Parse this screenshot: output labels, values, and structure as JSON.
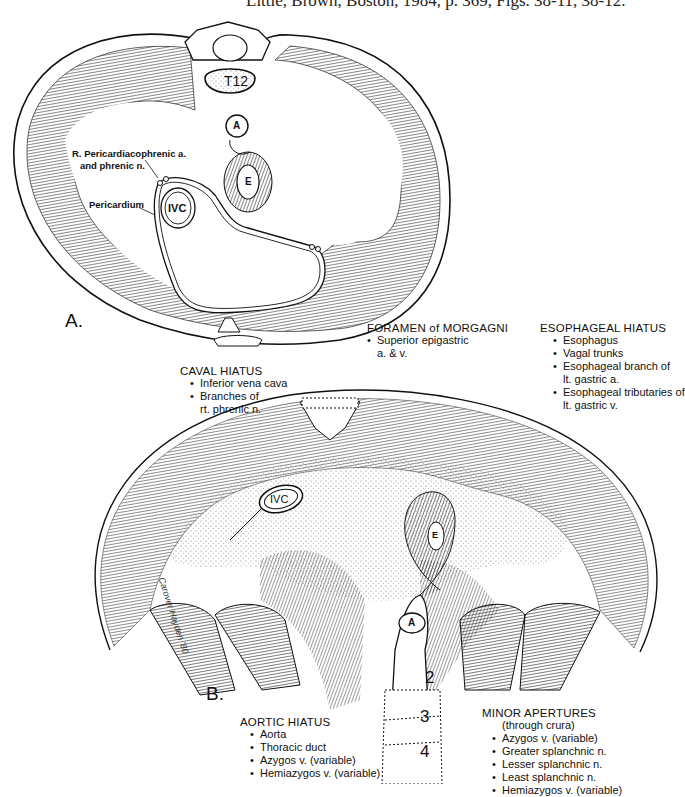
{
  "citation": "Little, Brown, Boston, 1984, p. 369, Figs. 38-11, 38-12.",
  "figure_a": {
    "label": "A.",
    "labels": {
      "vertebra": "T12",
      "aorta": "A",
      "esophagus": "E",
      "ivc": "IVC",
      "pericardiacophrenic_line1": "R. Pericardiacophrenic a.",
      "pericardiacophrenic_line2": "and phrenic n.",
      "pericardium": "Pericardium"
    }
  },
  "figure_b": {
    "label": "B.",
    "labels": {
      "ivc": "IVC",
      "esophagus": "E",
      "aorta": "A",
      "vertebrae": [
        "2",
        "3",
        "4"
      ],
      "signature": "Carover Hayden '80"
    },
    "callouts": {
      "foramen_morgagni": {
        "heading": "FORAMEN of MORGAGNI",
        "items": [
          "Superior epigastric"
        ],
        "continuation": "a. & v."
      },
      "esophageal_hiatus": {
        "heading": "ESOPHAGEAL HIATUS",
        "items": [
          {
            "text": "Esophagus"
          },
          {
            "text": "Vagal trunks"
          },
          {
            "text": "Esophageal branch of",
            "cont": "lt. gastric a."
          },
          {
            "text": "Esophageal tributaries of",
            "cont": "lt. gastric v."
          }
        ]
      },
      "caval_hiatus": {
        "heading": "CAVAL HIATUS",
        "items": [
          {
            "text": "Inferior vena cava"
          },
          {
            "text": "Branches of",
            "cont": "rt. phrenic n."
          }
        ]
      },
      "aortic_hiatus": {
        "heading": "AORTIC HIATUS",
        "items": [
          "Aorta",
          "Thoracic duct",
          "Azygos v. (variable)",
          "Hemiazygos v. (variable)"
        ]
      },
      "minor_apertures": {
        "heading": "MINOR APERTURES",
        "subheading": "(through crura)",
        "items": [
          "Azygos v. (variable)",
          "Greater splanchnic n.",
          "Lesser splanchnic n.",
          "Least splanchnic n.",
          "Hemiazygos v. (variable)"
        ]
      }
    }
  },
  "colors": {
    "ink": "#111111",
    "hatch": "#555555",
    "paper": "#ffffff"
  }
}
